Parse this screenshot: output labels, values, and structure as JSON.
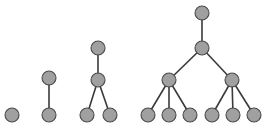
{
  "figure": {
    "title": "",
    "background_color": "#ffffff",
    "width": 265,
    "height": 131
  },
  "style": {
    "node_fill": "#a0a0a0",
    "node_stroke": "#4a4a4a",
    "node_radius": 7,
    "edge_color": "#3a3a3a",
    "edge_width": 1.6
  },
  "chart_data": {
    "type": "diagram",
    "subtype": "node-link-trees",
    "title": "",
    "trees": [
      {
        "name": "tree-1",
        "depth": 1,
        "node_count": 1,
        "nodes": [
          {
            "id": "t1-n1",
            "level": 0,
            "x": 12,
            "y": 115
          }
        ],
        "edges": []
      },
      {
        "name": "tree-2",
        "depth": 2,
        "node_count": 2,
        "nodes": [
          {
            "id": "t2-n1",
            "level": 0,
            "x": 49,
            "y": 78
          },
          {
            "id": "t2-n2",
            "level": 1,
            "x": 49,
            "y": 115
          }
        ],
        "edges": [
          {
            "from": "t2-n1",
            "to": "t2-n2"
          }
        ]
      },
      {
        "name": "tree-3",
        "depth": 3,
        "node_count": 4,
        "nodes": [
          {
            "id": "t3-n1",
            "level": 0,
            "x": 98,
            "y": 48
          },
          {
            "id": "t3-n2",
            "level": 1,
            "x": 98,
            "y": 80
          },
          {
            "id": "t3-n3",
            "level": 2,
            "x": 87,
            "y": 115
          },
          {
            "id": "t3-n4",
            "level": 2,
            "x": 110,
            "y": 115
          }
        ],
        "edges": [
          {
            "from": "t3-n1",
            "to": "t3-n2"
          },
          {
            "from": "t3-n2",
            "to": "t3-n3"
          },
          {
            "from": "t3-n2",
            "to": "t3-n4"
          }
        ]
      },
      {
        "name": "tree-4",
        "depth": 4,
        "node_count": 10,
        "nodes": [
          {
            "id": "t4-n1",
            "level": 0,
            "x": 202,
            "y": 13
          },
          {
            "id": "t4-n2",
            "level": 1,
            "x": 202,
            "y": 48
          },
          {
            "id": "t4-n3",
            "level": 2,
            "x": 169,
            "y": 80
          },
          {
            "id": "t4-n4",
            "level": 2,
            "x": 232,
            "y": 80
          },
          {
            "id": "t4-n5",
            "level": 3,
            "x": 148,
            "y": 115
          },
          {
            "id": "t4-n6",
            "level": 3,
            "x": 169,
            "y": 115
          },
          {
            "id": "t4-n7",
            "level": 3,
            "x": 190,
            "y": 115
          },
          {
            "id": "t4-n8",
            "level": 3,
            "x": 212,
            "y": 115
          },
          {
            "id": "t4-n9",
            "level": 3,
            "x": 233,
            "y": 115
          },
          {
            "id": "t4-n10",
            "level": 3,
            "x": 254,
            "y": 115
          }
        ],
        "edges": [
          {
            "from": "t4-n1",
            "to": "t4-n2"
          },
          {
            "from": "t4-n2",
            "to": "t4-n3"
          },
          {
            "from": "t4-n2",
            "to": "t4-n4"
          },
          {
            "from": "t4-n3",
            "to": "t4-n5"
          },
          {
            "from": "t4-n3",
            "to": "t4-n6"
          },
          {
            "from": "t4-n3",
            "to": "t4-n7"
          },
          {
            "from": "t4-n4",
            "to": "t4-n8"
          },
          {
            "from": "t4-n4",
            "to": "t4-n9"
          },
          {
            "from": "t4-n4",
            "to": "t4-n10"
          }
        ]
      }
    ]
  }
}
